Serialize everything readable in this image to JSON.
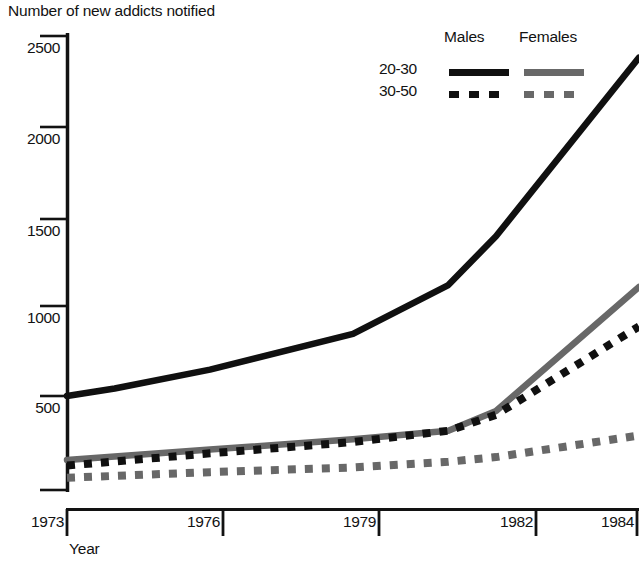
{
  "chart_data": {
    "type": "line",
    "title": "Number of new addicts notified",
    "xlabel": "Year",
    "ylabel": "",
    "xlim": [
      1973,
      1985
    ],
    "ylim": [
      0,
      2600
    ],
    "x_ticks": [
      1973,
      1976,
      1979,
      1982,
      1984
    ],
    "x_tick_labels": [
      "1973",
      "1976",
      "1979",
      "1982",
      "1984"
    ],
    "y_ticks": [
      0,
      500,
      1000,
      1500,
      2000,
      2500
    ],
    "y_tick_labels": [
      "",
      "500",
      "1000",
      "1500",
      "2000",
      "2500"
    ],
    "grid": false,
    "legend_position": "top-right",
    "legend_columns": [
      "Males",
      "Females"
    ],
    "legend_rows": [
      "20-30",
      "30-50"
    ],
    "series": [
      {
        "name": "Males 20-30",
        "sex": "Males",
        "age_group": "20-30",
        "color": "#101010",
        "style": "solid",
        "x": [
          1973,
          1974,
          1976,
          1979,
          1981,
          1982,
          1985
        ],
        "values": [
          500,
          540,
          640,
          830,
          1090,
          1350,
          2300
        ]
      },
      {
        "name": "Females 20-30",
        "sex": "Females",
        "age_group": "20-30",
        "color": "#686868",
        "style": "solid",
        "x": [
          1973,
          1976,
          1979,
          1981,
          1982,
          1985
        ],
        "values": [
          160,
          215,
          270,
          315,
          420,
          1080
        ]
      },
      {
        "name": "Males 30-50",
        "sex": "Males",
        "age_group": "30-50",
        "color": "#101010",
        "style": "dashed",
        "x": [
          1973,
          1976,
          1979,
          1981,
          1982,
          1985
        ],
        "values": [
          130,
          195,
          255,
          315,
          400,
          870
        ]
      },
      {
        "name": "Females 30-50",
        "sex": "Females",
        "age_group": "30-50",
        "color": "#686868",
        "style": "dashed",
        "x": [
          1973,
          1976,
          1979,
          1981,
          1982,
          1985
        ],
        "values": [
          65,
          95,
          120,
          150,
          175,
          290
        ]
      }
    ]
  },
  "colors": {
    "males": "#101010",
    "females": "#686868",
    "axis": "#121212",
    "background": "#ffffff"
  },
  "legend": {
    "males_label": "Males",
    "females_label": "Females",
    "row_20_30": "20-30",
    "row_30_50": "30-50"
  },
  "axes": {
    "title": "Number of new addicts notified",
    "x_label": "Year",
    "y_labels": {
      "t2500": "2500",
      "t2000": "2000",
      "t1500": "1500",
      "t1000": "1000",
      "t500": "500"
    },
    "x_labels": {
      "x1973": "1973",
      "x1976": "1976",
      "x1979": "1979",
      "x1982": "1982",
      "x1984": "1984"
    }
  }
}
